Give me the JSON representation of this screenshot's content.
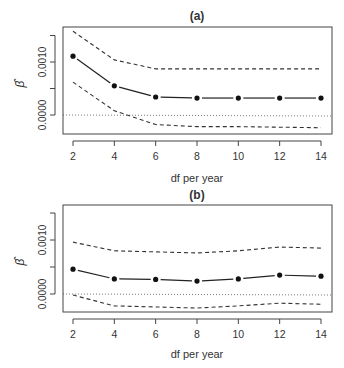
{
  "chart_data": [
    {
      "type": "line",
      "title": "(a)",
      "xlabel": "df per year",
      "ylabel": "β̂",
      "x": [
        2,
        4,
        6,
        8,
        10,
        12,
        14
      ],
      "xticks": [
        "2",
        "4",
        "6",
        "8",
        "10",
        "12",
        "14"
      ],
      "yticks": [
        {
          "value": 0.0,
          "label": "0.0000"
        },
        {
          "value": 0.0005,
          "label": ""
        },
        {
          "value": 0.001,
          "label": "0.0010"
        },
        {
          "value": 0.0015,
          "label": ""
        }
      ],
      "ylim": [
        -0.0003,
        0.0017
      ],
      "reference_line": 0.0,
      "series": [
        {
          "name": "estimate",
          "style": "solid-with-points",
          "values": [
            0.00111,
            0.00055,
            0.00034,
            0.00032,
            0.00032,
            0.00032,
            0.00032
          ]
        },
        {
          "name": "upper 95% CI",
          "style": "dashed",
          "values": [
            0.00158,
            0.00104,
            0.00087,
            0.00087,
            0.00087,
            0.00087,
            0.00087
          ]
        },
        {
          "name": "lower 95% CI",
          "style": "dashed",
          "values": [
            0.00062,
            8e-05,
            -0.00018,
            -0.00022,
            -0.00022,
            -0.00023,
            -0.00024
          ]
        }
      ],
      "grid": false
    },
    {
      "type": "line",
      "title": "(b)",
      "xlabel": "df per year",
      "ylabel": "β̂",
      "x": [
        2,
        4,
        6,
        8,
        10,
        12,
        14
      ],
      "xticks": [
        "2",
        "4",
        "6",
        "8",
        "10",
        "12",
        "14"
      ],
      "yticks": [
        {
          "value": 0.0,
          "label": "0.0000"
        },
        {
          "value": 0.0005,
          "label": ""
        },
        {
          "value": 0.001,
          "label": "0.0010"
        },
        {
          "value": 0.0015,
          "label": ""
        }
      ],
      "ylim": [
        -0.0003,
        0.0017
      ],
      "reference_line": 0.0,
      "series": [
        {
          "name": "estimate",
          "style": "solid-with-points",
          "values": [
            0.00046,
            0.00028,
            0.00027,
            0.00024,
            0.00028,
            0.00035,
            0.00033
          ]
        },
        {
          "name": "upper 95% CI",
          "style": "dashed",
          "values": [
            0.00096,
            0.0008,
            0.00078,
            0.00076,
            0.0008,
            0.00087,
            0.00085
          ]
        },
        {
          "name": "lower 95% CI",
          "style": "dashed",
          "values": [
            -2e-05,
            -0.00022,
            -0.00024,
            -0.00026,
            -0.00022,
            -0.00017,
            -0.00019
          ]
        }
      ],
      "grid": false
    }
  ],
  "panels": [
    {
      "title": "(a)",
      "xlabel": "df per year",
      "ylabel": "β̂"
    },
    {
      "title": "(b)",
      "xlabel": "df per year",
      "ylabel": "β̂"
    }
  ]
}
